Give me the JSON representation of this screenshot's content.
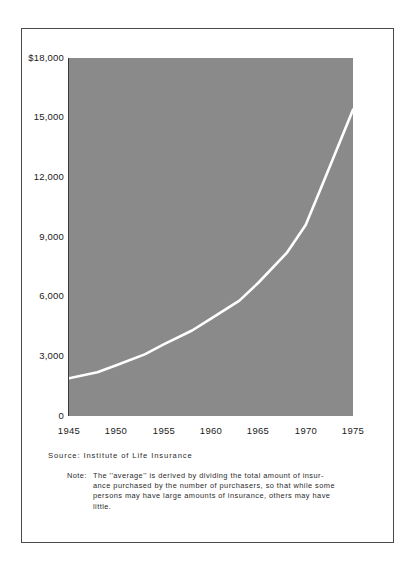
{
  "figure": {
    "source_line": "Source:  Institute  of  Life  Insurance",
    "note_label": "Note:",
    "note_lines": [
      "The  ''average''  is  derived  by  dividing  the  total  amount  of  insur-",
      "ance purchased by the number of purchasers, so that while some",
      "persons  may  have  large  amounts  of  insurance,  others  may  have",
      "little."
    ]
  },
  "colors": {
    "plot_fill": "#8a8a8a",
    "line": "#ffffff",
    "frame": "#4a4a4a",
    "text": "#1a1a1a",
    "axis": "#3a3a3a"
  },
  "chart_data": {
    "type": "line",
    "title": "",
    "subtitle": "",
    "xlabel": "",
    "ylabel": "",
    "grid": false,
    "legend_position": "none",
    "xlim": [
      1945,
      1975
    ],
    "ylim": [
      0,
      18000
    ],
    "y_tick_labels": [
      "$18,000",
      "15,000",
      "12,000",
      "9,000",
      "6,000",
      "3,000",
      "0"
    ],
    "y_ticks": [
      18000,
      15000,
      12000,
      9000,
      6000,
      3000,
      0
    ],
    "x_tick_labels": [
      "1945",
      "1950",
      "1955",
      "1960",
      "1965",
      "1970",
      "1975"
    ],
    "x_ticks": [
      1945,
      1950,
      1955,
      1960,
      1965,
      1970,
      1975
    ],
    "series": [
      {
        "name": "Average size of life insurance purchase",
        "color": "#ffffff",
        "x": [
          1945,
          1948,
          1950,
          1953,
          1955,
          1958,
          1960,
          1963,
          1965,
          1968,
          1970,
          1972,
          1975
        ],
        "values": [
          1900,
          2200,
          2550,
          3100,
          3600,
          4300,
          4900,
          5800,
          6700,
          8200,
          9600,
          11900,
          15400
        ]
      }
    ],
    "annotations": []
  }
}
